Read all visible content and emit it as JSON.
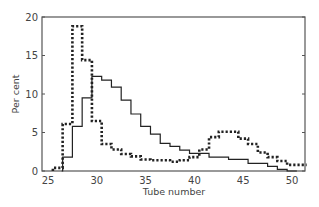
{
  "chart_data": {
    "type": "line",
    "subtype": "step-histogram",
    "title": "",
    "xlabel": "Tube number",
    "ylabel": "Per cent",
    "xlim": [
      24.4,
      51.2
    ],
    "ylim": [
      0,
      20
    ],
    "xticks": [
      25,
      30,
      35,
      40,
      45,
      50
    ],
    "yticks": [
      0,
      5,
      10,
      15,
      20
    ],
    "grid": false,
    "legend": null,
    "series": [
      {
        "name": "solid",
        "style": "solid",
        "color": "#222222",
        "steps": [
          [
            26.4,
            0
          ],
          [
            26.5,
            1.8
          ],
          [
            27.5,
            5.8
          ],
          [
            28.5,
            9.5
          ],
          [
            29.5,
            12.3
          ],
          [
            30.5,
            11.8
          ],
          [
            31.5,
            10.9
          ],
          [
            32.5,
            9.2
          ],
          [
            33.5,
            7.4
          ],
          [
            34.5,
            5.8
          ],
          [
            35.5,
            4.8
          ],
          [
            36.5,
            3.6
          ],
          [
            37.5,
            3.2
          ],
          [
            38.5,
            2.7
          ],
          [
            39.5,
            2.3
          ],
          [
            41.5,
            1.8
          ],
          [
            43.5,
            1.5
          ],
          [
            45.5,
            1.0
          ],
          [
            47.5,
            0.6
          ],
          [
            48.5,
            0.2
          ],
          [
            49.5,
            0
          ]
        ]
      },
      {
        "name": "dotted",
        "style": "dotted",
        "color": "#222222",
        "steps": [
          [
            25.5,
            0.4
          ],
          [
            26.5,
            6.1
          ],
          [
            27.5,
            18.8
          ],
          [
            28.5,
            14.4
          ],
          [
            29.5,
            6.5
          ],
          [
            30.5,
            3.5
          ],
          [
            31.5,
            2.8
          ],
          [
            32.5,
            2.2
          ],
          [
            33.5,
            1.9
          ],
          [
            34.5,
            1.5
          ],
          [
            35.5,
            1.4
          ],
          [
            36.5,
            1.4
          ],
          [
            37.5,
            1.2
          ],
          [
            38.5,
            1.4
          ],
          [
            39.5,
            1.8
          ],
          [
            40.5,
            2.8
          ],
          [
            41.5,
            4.4
          ],
          [
            42.5,
            5.1
          ],
          [
            44.5,
            4.2
          ],
          [
            45.5,
            3.5
          ],
          [
            46.5,
            2.4
          ],
          [
            47.5,
            1.8
          ],
          [
            48.5,
            1.3
          ],
          [
            49.5,
            0.8
          ],
          [
            50.5,
            0.8
          ]
        ]
      }
    ]
  }
}
